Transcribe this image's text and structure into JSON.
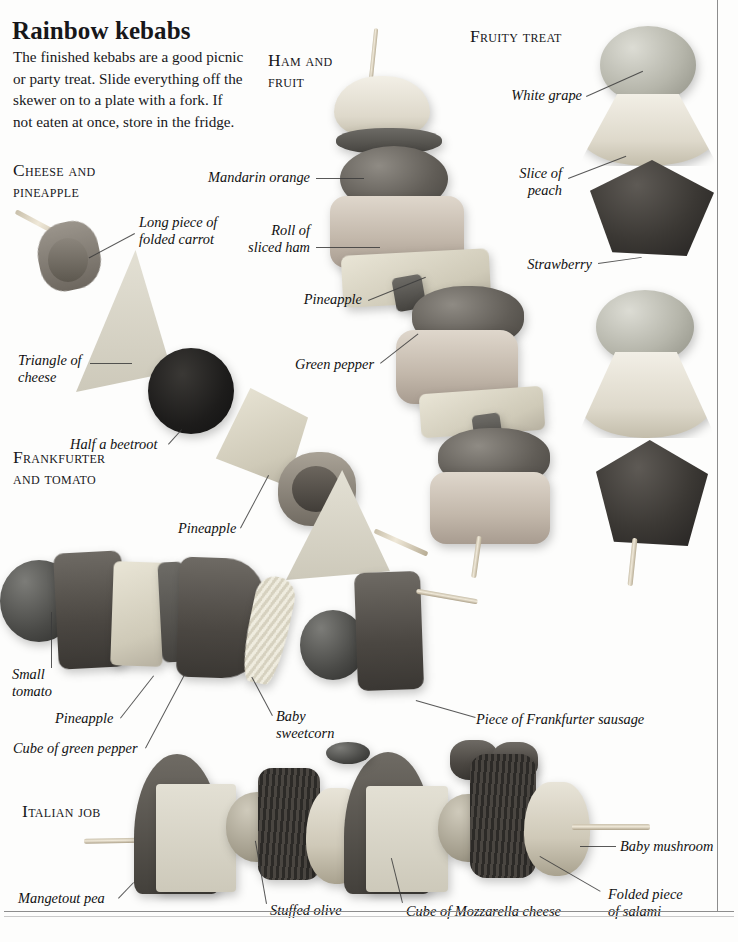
{
  "page": {
    "title": "Rainbow kebabs",
    "intro": "The finished kebabs are a good picnic or party treat. Slide everything off the skewer on to a plate with a fork. If not eaten at once, store in the fridge."
  },
  "sections": [
    {
      "id": "cheese-and-pineapple",
      "heading": "Cheese and\npineapple"
    },
    {
      "id": "ham-and-fruit",
      "heading": "Ham and\nfruit"
    },
    {
      "id": "fruity-treat",
      "heading": "Fruity treat"
    },
    {
      "id": "frankfurter-and-tomato",
      "heading": "Frankfurter\nand tomato"
    },
    {
      "id": "italian-job",
      "heading": "Italian job"
    }
  ],
  "labels": {
    "long_piece_of_folded_carrot": "Long piece of\nfolded carrot",
    "triangle_of_cheese": "Triangle of\ncheese",
    "half_a_beetroot": "Half a beetroot",
    "mandarin_orange": "Mandarin orange",
    "roll_of_sliced_ham": "Roll of\nsliced ham",
    "pineapple_ham": "Pineapple",
    "green_pepper": "Green pepper",
    "white_grape": "White grape",
    "slice_of_peach": "Slice of\npeach",
    "strawberry": "Strawberry",
    "pineapple_mid": "Pineapple",
    "small_tomato": "Small\ntomato",
    "pineapple_frank": "Pineapple",
    "cube_of_green_pepper": "Cube of green pepper",
    "baby_sweetcorn": "Baby\nsweetcorn",
    "piece_of_frankfurter_sausage": "Piece of Frankfurter sausage",
    "mangetout_pea": "Mangetout pea",
    "stuffed_olive": "Stuffed olive",
    "cube_of_mozzarella_cheese": "Cube of Mozzarella cheese",
    "baby_mushroom": "Baby mushroom",
    "folded_piece_of_salami": "Folded piece\nof salami"
  },
  "colors": {
    "page_background": "#fdfdfc",
    "text": "#17171a",
    "rule": "#8d8d8d",
    "leader_line": "#3b3b3b"
  }
}
